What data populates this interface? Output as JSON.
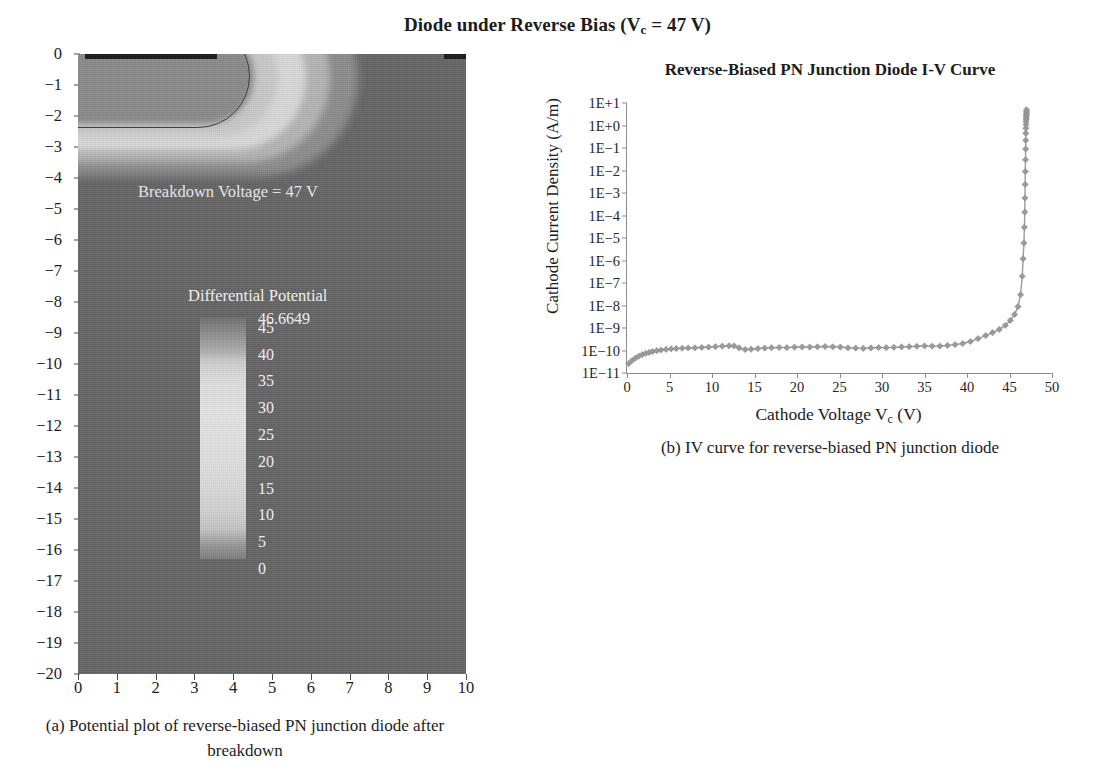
{
  "figure": {
    "title_main": "Diode under Reverse Bias (V",
    "title_sub": "c",
    "title_tail": " = 47 V)"
  },
  "panel_a": {
    "caption": "(a)  Potential plot of reverse-biased PN junction diode after breakdown",
    "annotation": "Breakdown Voltage = 47 V",
    "legend_title": "Differential Potential",
    "legend_values": [
      "46.6649",
      "45",
      "40",
      "35",
      "30",
      "25",
      "20",
      "15",
      "10",
      "5",
      "0"
    ],
    "y_ticks": [
      "0",
      "−1",
      "−2",
      "−3",
      "−4",
      "−5",
      "−6",
      "−7",
      "−8",
      "−9",
      "−10",
      "−11",
      "−12",
      "−13",
      "−14",
      "−15",
      "−16",
      "−17",
      "−18",
      "−19",
      "−20"
    ],
    "x_ticks": [
      "0",
      "1",
      "2",
      "3",
      "4",
      "5",
      "6",
      "7",
      "8",
      "9",
      "10"
    ],
    "field_color": "#666666",
    "contact_color": "#1d1d1d"
  },
  "panel_b": {
    "caption": "(b)  IV curve for reverse-biased PN junction diode",
    "xlabel_main": "Cathode Voltage V",
    "xlabel_sub": "c",
    "xlabel_tail": " (V)",
    "ylabel": "Cathode Current Density (A/m)"
  },
  "chart_data": {
    "type": "line",
    "title": "Reverse-Biased PN Junction Diode I-V Curve",
    "xlabel": "Cathode Voltage Vc (V)",
    "ylabel": "Cathode Current Density (A/m)",
    "yscale": "log",
    "xlim": [
      0,
      50
    ],
    "ylim": [
      1e-11,
      10
    ],
    "grid": false,
    "legend": "none",
    "marker": "diamond",
    "line_color": "#9a9a9a",
    "x_tick_labels": [
      "0",
      "5",
      "10",
      "15",
      "20",
      "25",
      "30",
      "35",
      "40",
      "45",
      "50"
    ],
    "y_tick_labels": [
      "1E+1",
      "1E+0",
      "1E-1",
      "1E-2",
      "1E-3",
      "1E-4",
      "1E-5",
      "1E-6",
      "1E-7",
      "1E-8",
      "1E-9",
      "1E-10",
      "1E-11"
    ],
    "x": [
      0.2,
      0.6,
      1.0,
      1.4,
      1.8,
      2.2,
      2.6,
      3.0,
      3.5,
      4.0,
      4.6,
      5.2,
      5.8,
      6.5,
      7.2,
      8.0,
      8.8,
      9.6,
      10.4,
      11.2,
      12.0,
      12.6,
      13.2,
      13.9,
      14.6,
      15.4,
      16.2,
      17.0,
      17.9,
      18.8,
      19.7,
      20.6,
      21.5,
      22.4,
      23.3,
      24.2,
      25.1,
      26.0,
      26.9,
      27.8,
      28.7,
      29.6,
      30.5,
      31.4,
      32.3,
      33.2,
      34.1,
      35.0,
      35.9,
      36.8,
      37.7,
      38.6,
      39.5,
      40.4,
      41.3,
      42.2,
      43.0,
      43.8,
      44.5,
      45.1,
      45.6,
      46.0,
      46.3,
      46.5,
      46.6,
      46.7,
      46.75,
      46.8,
      46.82,
      46.84,
      46.86,
      46.88,
      46.9,
      46.91,
      46.92,
      46.93,
      46.94,
      46.95,
      46.96,
      46.97,
      46.98,
      46.99,
      47.0,
      47.0,
      47.0
    ],
    "y": [
      2.6e-11,
      3.6e-11,
      4.6e-11,
      5.6e-11,
      6.6e-11,
      7.4e-11,
      8.2e-11,
      9e-11,
      9.8e-11,
      1.05e-10,
      1.12e-10,
      1.18e-10,
      1.22e-10,
      1.26e-10,
      1.29e-10,
      1.32e-10,
      1.36e-10,
      1.42e-10,
      1.48e-10,
      1.55e-10,
      1.62e-10,
      1.6e-10,
      1.3e-10,
      1.1e-10,
      1.14e-10,
      1.22e-10,
      1.28e-10,
      1.33e-10,
      1.36e-10,
      1.34e-10,
      1.4e-10,
      1.44e-10,
      1.42e-10,
      1.46e-10,
      1.5e-10,
      1.46e-10,
      1.42e-10,
      1.32e-10,
      1.28e-10,
      1.24e-10,
      1.3e-10,
      1.36e-10,
      1.34e-10,
      1.38e-10,
      1.44e-10,
      1.48e-10,
      1.54e-10,
      1.6e-10,
      1.56e-10,
      1.58e-10,
      1.68e-10,
      1.82e-10,
      2.05e-10,
      2.5e-10,
      3.4e-10,
      4.6e-10,
      6.2e-10,
      8.6e-10,
      1.3e-09,
      2.2e-09,
      4e-09,
      9e-09,
      3e-08,
      2e-07,
      1.2e-06,
      6e-06,
      3e-05,
      0.00014,
      0.0006,
      0.0024,
      0.009,
      0.03,
      0.09,
      0.22,
      0.45,
      0.75,
      1.1,
      1.5,
      1.9,
      2.3,
      2.7,
      3.1,
      3.6,
      4.2,
      5.0
    ]
  }
}
